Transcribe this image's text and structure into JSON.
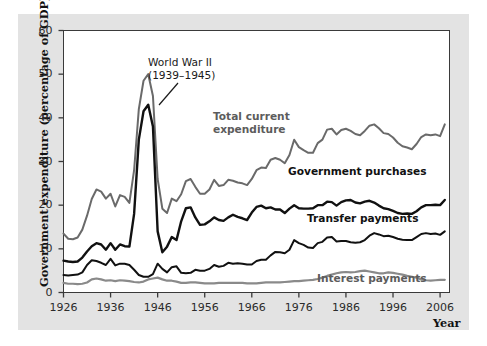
{
  "figure": {
    "background": "#ffffff",
    "panel_color": "#e3e3e3",
    "plot_background": "#ffffff",
    "frame_color": "#3a3a3a"
  },
  "chart_data": {
    "type": "line",
    "title": "",
    "xlabel": "Year",
    "ylabel": "Government expenditure (percentage of GDP)",
    "xlim": [
      1926,
      2008
    ],
    "ylim": [
      0,
      60
    ],
    "grid": false,
    "legend_position": "inline-annotations",
    "xticks": [
      1926,
      1936,
      1946,
      1956,
      1966,
      1976,
      1986,
      1996,
      2006
    ],
    "yticks": [
      0,
      10,
      20,
      30,
      40,
      50,
      60
    ],
    "annotations": [
      {
        "name": "world-war-2",
        "line1": "World War II",
        "line2": "(1939–1945)",
        "style": "plain",
        "x_px": 148,
        "y_px": 56,
        "leader": {
          "x1": 178,
          "y1": 83,
          "x2": 159,
          "y2": 105
        }
      },
      {
        "name": "total-current-expenditure",
        "line1": "Total current",
        "line2": "expenditure",
        "style": "gray-bold",
        "x_px": 213,
        "y_px": 110
      },
      {
        "name": "government-purchases",
        "line1": "Government purchases",
        "line2": "",
        "style": "bold",
        "x_px": 288,
        "y_px": 165
      },
      {
        "name": "transfer-payments",
        "line1": "Transfer payments",
        "line2": "",
        "style": "bold",
        "x_px": 307,
        "y_px": 212
      },
      {
        "name": "interest-payments",
        "line1": "Interest payments",
        "line2": "",
        "style": "gray-bold",
        "x_px": 317,
        "y_px": 272
      }
    ],
    "x": [
      1926,
      1927,
      1928,
      1929,
      1930,
      1931,
      1932,
      1933,
      1934,
      1935,
      1936,
      1937,
      1938,
      1939,
      1940,
      1941,
      1942,
      1943,
      1944,
      1945,
      1946,
      1947,
      1948,
      1949,
      1950,
      1951,
      1952,
      1953,
      1954,
      1955,
      1956,
      1957,
      1958,
      1959,
      1960,
      1961,
      1962,
      1963,
      1964,
      1965,
      1966,
      1967,
      1968,
      1969,
      1970,
      1971,
      1972,
      1973,
      1974,
      1975,
      1976,
      1977,
      1978,
      1979,
      1980,
      1981,
      1982,
      1983,
      1984,
      1985,
      1986,
      1987,
      1988,
      1989,
      1990,
      1991,
      1992,
      1993,
      1994,
      1995,
      1996,
      1997,
      1998,
      1999,
      2000,
      2001,
      2002,
      2003,
      2004,
      2005,
      2006,
      2007
    ],
    "series": [
      {
        "name": "Total current expenditure",
        "color": "#6a6a6a",
        "width": 2.0,
        "values": [
          13.5,
          12.3,
          12.2,
          12.6,
          14.4,
          17.6,
          21.4,
          23.6,
          23.1,
          21.5,
          22.6,
          19.7,
          22.3,
          21.9,
          20.5,
          28.0,
          42.0,
          48.5,
          50.0,
          45.0,
          26.0,
          19.2,
          18.2,
          21.5,
          20.9,
          22.5,
          25.5,
          26.0,
          24.2,
          22.6,
          22.6,
          23.6,
          25.8,
          24.4,
          24.6,
          25.8,
          25.6,
          25.2,
          25.0,
          24.6,
          26.0,
          28.0,
          28.6,
          28.5,
          30.4,
          30.8,
          30.4,
          29.6,
          31.5,
          35.0,
          33.3,
          32.6,
          32.0,
          32.0,
          34.2,
          35.0,
          37.3,
          37.5,
          36.2,
          37.2,
          37.5,
          37.0,
          36.3,
          36.0,
          37.0,
          38.2,
          38.5,
          37.6,
          36.5,
          36.3,
          35.5,
          34.3,
          33.5,
          33.2,
          32.8,
          34.0,
          35.6,
          36.2,
          36.0,
          36.2,
          35.8,
          38.5
        ]
      },
      {
        "name": "Government purchases",
        "color": "#111111",
        "width": 2.4,
        "values": [
          7.3,
          7.1,
          7.0,
          7.1,
          8.0,
          9.4,
          10.6,
          11.3,
          11.0,
          9.8,
          11.3,
          9.8,
          11.0,
          10.6,
          10.5,
          18.0,
          35.0,
          41.5,
          43.0,
          38.0,
          14.0,
          9.2,
          10.5,
          12.7,
          12.0,
          16.3,
          19.3,
          19.5,
          17.2,
          15.5,
          15.6,
          16.3,
          17.2,
          16.6,
          16.4,
          17.2,
          17.8,
          17.3,
          17.0,
          16.6,
          18.3,
          19.6,
          19.9,
          19.3,
          19.5,
          19.0,
          19.0,
          18.2,
          19.2,
          20.0,
          19.3,
          19.2,
          19.2,
          19.3,
          20.0,
          20.0,
          20.8,
          20.7,
          19.9,
          20.7,
          21.1,
          21.2,
          20.6,
          20.4,
          20.8,
          21.0,
          20.6,
          19.9,
          19.3,
          19.1,
          18.7,
          18.2,
          18.0,
          18.1,
          18.0,
          18.6,
          19.5,
          20.0,
          20.0,
          20.1,
          20.0,
          21.2
        ]
      },
      {
        "name": "Transfer payments",
        "color": "#111111",
        "width": 2.0,
        "values": [
          4.0,
          3.9,
          4.0,
          4.1,
          4.6,
          6.3,
          7.4,
          7.2,
          6.8,
          6.3,
          7.7,
          6.2,
          6.6,
          6.6,
          6.3,
          5.2,
          4.0,
          3.6,
          3.6,
          4.2,
          6.6,
          5.4,
          4.6,
          5.8,
          6.0,
          4.5,
          4.4,
          4.5,
          5.2,
          5.0,
          5.0,
          5.4,
          6.3,
          5.9,
          6.1,
          6.8,
          6.6,
          6.7,
          6.6,
          6.4,
          6.4,
          7.2,
          7.5,
          7.5,
          8.5,
          9.3,
          9.2,
          9.0,
          9.8,
          12.0,
          11.3,
          10.9,
          10.3,
          10.2,
          11.3,
          11.6,
          12.6,
          12.7,
          11.7,
          11.8,
          11.8,
          11.5,
          11.4,
          11.5,
          12.0,
          13.0,
          13.6,
          13.3,
          12.9,
          13.0,
          12.7,
          12.3,
          12.1,
          12.0,
          12.0,
          12.7,
          13.4,
          13.6,
          13.4,
          13.5,
          13.2,
          14.0
        ]
      },
      {
        "name": "Interest payments",
        "color": "#8a8a8a",
        "width": 2.2,
        "values": [
          2.2,
          2.0,
          2.0,
          1.9,
          2.0,
          2.3,
          3.0,
          3.2,
          3.0,
          2.7,
          2.8,
          2.6,
          2.8,
          2.7,
          2.6,
          2.4,
          2.3,
          2.5,
          3.0,
          3.2,
          3.4,
          3.0,
          2.7,
          2.7,
          2.5,
          2.2,
          2.2,
          2.3,
          2.3,
          2.2,
          2.1,
          2.1,
          2.1,
          2.2,
          2.2,
          2.2,
          2.2,
          2.2,
          2.2,
          2.1,
          2.1,
          2.1,
          2.2,
          2.3,
          2.3,
          2.3,
          2.3,
          2.4,
          2.5,
          2.6,
          2.6,
          2.7,
          2.8,
          2.9,
          3.1,
          3.4,
          3.8,
          4.1,
          4.4,
          4.6,
          4.7,
          4.6,
          4.7,
          4.9,
          5.0,
          4.8,
          4.6,
          4.4,
          4.4,
          4.6,
          4.5,
          4.3,
          4.1,
          3.8,
          3.6,
          3.4,
          3.0,
          2.8,
          2.7,
          2.8,
          2.9,
          2.9
        ]
      }
    ]
  }
}
